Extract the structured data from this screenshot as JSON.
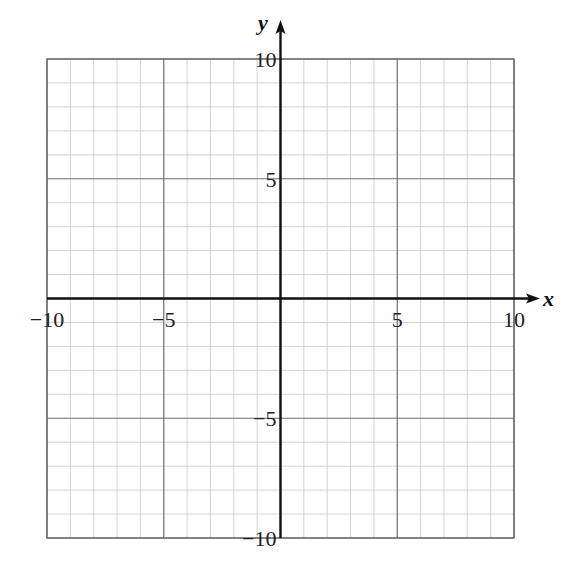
{
  "chart_data": {
    "type": "scatter",
    "title": "",
    "xlabel": "x",
    "ylabel": "y",
    "xlim": [
      -10,
      10
    ],
    "ylim": [
      -10,
      10
    ],
    "grid": true,
    "grid_minor_step": 1,
    "grid_major_step": 5,
    "x_tick_labels": [
      "-10",
      "-5",
      "5",
      "10"
    ],
    "y_tick_labels": [
      "10",
      "5",
      "-5",
      "-10"
    ],
    "series": [],
    "legend": null
  },
  "labels": {
    "x_axis": "x",
    "y_axis": "y",
    "x_ticks": [
      {
        "value": -10,
        "text": "−10"
      },
      {
        "value": -5,
        "text": "−5"
      },
      {
        "value": 5,
        "text": "5"
      },
      {
        "value": 10,
        "text": "10"
      }
    ],
    "y_ticks": [
      {
        "value": 10,
        "text": "10"
      },
      {
        "value": 5,
        "text": "5"
      },
      {
        "value": -5,
        "text": "−5"
      },
      {
        "value": -10,
        "text": "−10"
      }
    ]
  },
  "colors": {
    "minor_grid": "#c8c8c8",
    "major_grid": "#6e6e6e",
    "axis": "#111111",
    "border": "#6e6e6e"
  }
}
